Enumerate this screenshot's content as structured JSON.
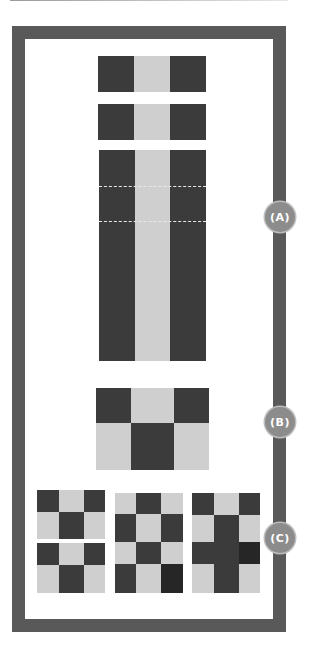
{
  "diagram": {
    "title": "",
    "colors": {
      "frame": "#595959",
      "dark_cell": "#3b3b3b",
      "darker_cell": "#262626",
      "light_cell": "#cfcfcf",
      "badge": "#8c8c8c",
      "badge_text": "#ffffff"
    },
    "labels": {
      "a": "(A)",
      "b": "(B)",
      "c": "(C)"
    },
    "section_a": {
      "description": "Two short 1x3 strips (dark-light-dark) above a tall 1x3 column strip divided by two dashed lines",
      "strip_pattern": [
        "dark",
        "light",
        "dark"
      ],
      "dashed_lines": 2
    },
    "section_b": {
      "description": "2x3 block",
      "rows": [
        [
          "dark",
          "light",
          "dark"
        ],
        [
          "light",
          "dark",
          "light"
        ]
      ]
    },
    "section_c": {
      "description": "Three grid variants",
      "grids": [
        {
          "rows": [
            [
              "dark",
              "light",
              "dark"
            ],
            [
              "light",
              "dark",
              "light"
            ],
            [
              "dark",
              "light",
              "dark"
            ],
            [
              "light",
              "dark",
              "light"
            ]
          ],
          "split": true
        },
        {
          "rows": [
            [
              "light",
              "dark",
              "light"
            ],
            [
              "dark",
              "light",
              "dark"
            ],
            [
              "light",
              "dark",
              "light"
            ],
            [
              "dark",
              "light",
              "darker"
            ]
          ],
          "split": false
        },
        {
          "rows": [
            [
              "dark",
              "light",
              "dark"
            ],
            [
              "light",
              "dark",
              "light"
            ],
            [
              "dark",
              "dark",
              "darker"
            ],
            [
              "light",
              "dark",
              "light"
            ]
          ],
          "split": false
        }
      ]
    }
  }
}
